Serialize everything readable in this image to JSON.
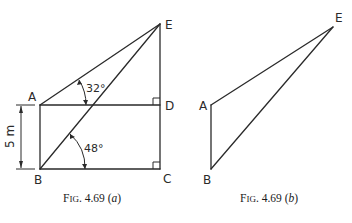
{
  "figure_a": {
    "points": {
      "A": {
        "label": "A",
        "x": 40,
        "y": 105
      },
      "B": {
        "label": "B",
        "x": 40,
        "y": 169
      },
      "C": {
        "label": "C",
        "x": 160,
        "y": 169
      },
      "D": {
        "label": "D",
        "x": 160,
        "y": 105
      },
      "E": {
        "label": "E",
        "x": 160,
        "y": 24
      }
    },
    "angles": {
      "angle_at_A": "32°",
      "angle_at_B": "48°"
    },
    "dimension": {
      "label": "5 m"
    },
    "caption": {
      "prefix": "F",
      "smallcaps": "IG",
      "number": ". 4.69 (",
      "letter": "a",
      "close": ")"
    }
  },
  "figure_b": {
    "points": {
      "A": {
        "label": "A",
        "x": 211,
        "y": 105
      },
      "B": {
        "label": "B",
        "x": 211,
        "y": 169
      },
      "E": {
        "label": "E",
        "x": 333,
        "y": 27
      }
    },
    "caption": {
      "prefix": "F",
      "smallcaps": "IG",
      "number": ". 4.69 (",
      "letter": "b",
      "close": ")"
    }
  }
}
